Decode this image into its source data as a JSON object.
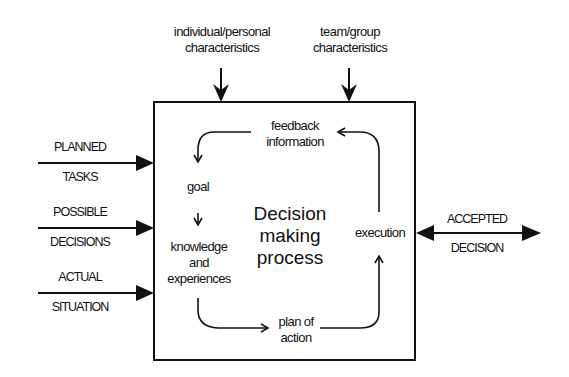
{
  "top_inputs": [
    {
      "line1": "individual/personal",
      "line2": "characteristics"
    },
    {
      "line1": "team/group",
      "line2": "characteristics"
    }
  ],
  "left_inputs": [
    {
      "line1": "PLANNED",
      "line2": "TASKS"
    },
    {
      "line1": "POSSIBLE",
      "line2": "DECISIONS"
    },
    {
      "line1": "ACTUAL",
      "line2": "SITUATION"
    }
  ],
  "output": {
    "line1": "ACCEPTED",
    "line2": "DECISION"
  },
  "process": {
    "title_line1": "Decision",
    "title_line2": "making",
    "title_line3": "process",
    "feedback_line1": "feedback",
    "feedback_line2": "information",
    "goal": "goal",
    "knowledge_line1": "knowledge",
    "knowledge_line2": "and",
    "knowledge_line3": "experiences",
    "plan_line1": "plan of",
    "plan_line2": "action",
    "execution": "execution"
  }
}
